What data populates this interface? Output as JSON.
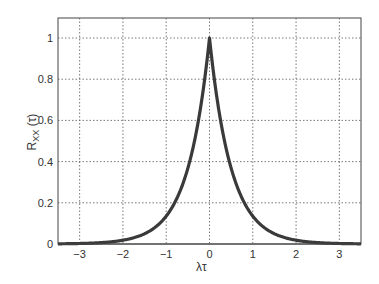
{
  "chart_data": {
    "type": "line",
    "title": "",
    "xlabel": "λτ",
    "ylabel": "R_XX (τ)",
    "ylabel_main": "R",
    "ylabel_sub": "XX",
    "ylabel_arg": "(τ)",
    "xlim": [
      -3.5,
      3.5
    ],
    "ylim": [
      0,
      1.1
    ],
    "grid": true,
    "legend": null,
    "x_ticks": [
      -3,
      -2,
      -1,
      0,
      1,
      2,
      3
    ],
    "x_tick_labels": [
      "−3",
      "−2",
      "−1",
      "0",
      "1",
      "2",
      "3"
    ],
    "y_ticks": [
      0,
      0.2,
      0.4,
      0.6,
      0.8,
      1
    ],
    "y_tick_labels": [
      "0",
      "0.2",
      "0.4",
      "0.6",
      "0.8",
      "1"
    ],
    "series": [
      {
        "name": "R_XX(τ) = exp(-2|λτ|)",
        "color": "#3a3a3a",
        "x": [
          -3.5,
          -3,
          -2.5,
          -2,
          -1.5,
          -1,
          -0.75,
          -0.5,
          -0.25,
          0,
          0.25,
          0.5,
          0.75,
          1,
          1.5,
          2,
          2.5,
          3,
          3.5
        ],
        "y": [
          0.001,
          0.002,
          0.007,
          0.018,
          0.05,
          0.135,
          0.223,
          0.368,
          0.607,
          1.0,
          0.607,
          0.368,
          0.223,
          0.135,
          0.05,
          0.018,
          0.007,
          0.002,
          0.001
        ]
      }
    ]
  }
}
